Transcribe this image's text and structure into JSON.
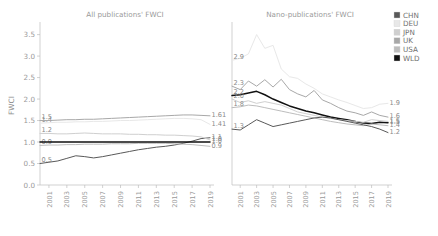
{
  "figure": {
    "y_axis_label": "FWCI",
    "y_ticks": [
      "0.0",
      "0.5",
      "1.0",
      "1.5",
      "2.0",
      "2.5",
      "3.0",
      "3.5"
    ],
    "x_ticks": [
      "2001",
      "2003",
      "2005",
      "2007",
      "2009",
      "2011",
      "2013",
      "2015",
      "2017",
      "2019"
    ]
  },
  "legend": {
    "position": "right",
    "items": [
      {
        "label": "CHN",
        "color": "#595959"
      },
      {
        "label": "DEU",
        "color": "#e8e8e8"
      },
      {
        "label": "JPN",
        "color": "#cfcfcf"
      },
      {
        "label": "UK",
        "color": "#a8a8a8"
      },
      {
        "label": "USA",
        "color": "#bdbdbd"
      },
      {
        "label": "WLD",
        "color": "#111111"
      }
    ]
  },
  "panels": [
    {
      "id": "all",
      "title": "All publications' FWCI"
    },
    {
      "id": "nano",
      "title": "Nano-publications' FWCI"
    }
  ],
  "chart_data": [
    {
      "type": "line",
      "panel": "All publications' FWCI",
      "title": "All publications' FWCI",
      "xlabel": "",
      "ylabel": "FWCI",
      "ylim": [
        0.0,
        3.7
      ],
      "xlim": [
        2000,
        2019
      ],
      "grid": false,
      "x": [
        2000,
        2001,
        2002,
        2003,
        2004,
        2005,
        2006,
        2007,
        2008,
        2009,
        2010,
        2011,
        2012,
        2013,
        2014,
        2015,
        2016,
        2017,
        2018,
        2019
      ],
      "series": [
        {
          "name": "CHN",
          "color": "#595959",
          "values": [
            0.5,
            0.53,
            0.56,
            0.62,
            0.68,
            0.66,
            0.63,
            0.66,
            0.7,
            0.74,
            0.78,
            0.82,
            0.85,
            0.88,
            0.9,
            0.93,
            0.97,
            1.02,
            1.08,
            1.1
          ],
          "start_label": "0.5",
          "end_label": "1.1"
        },
        {
          "name": "DEU",
          "color": "#e8e8e8",
          "values": [
            1.44,
            1.45,
            1.46,
            1.46,
            1.47,
            1.47,
            1.48,
            1.48,
            1.49,
            1.5,
            1.5,
            1.51,
            1.52,
            1.53,
            1.54,
            1.55,
            1.55,
            1.54,
            1.52,
            1.41
          ],
          "start_label": "1.4",
          "end_label": "1.41"
        },
        {
          "name": "JPN",
          "color": "#cfcfcf",
          "values": [
            1.2,
            1.2,
            1.19,
            1.19,
            1.2,
            1.21,
            1.2,
            1.19,
            1.19,
            1.19,
            1.18,
            1.18,
            1.17,
            1.17,
            1.16,
            1.16,
            1.15,
            1.14,
            1.12,
            1.05
          ],
          "start_label": "1.2",
          "end_label": "1.0"
        },
        {
          "name": "UK",
          "color": "#a8a8a8",
          "values": [
            1.5,
            1.5,
            1.51,
            1.52,
            1.52,
            1.53,
            1.53,
            1.54,
            1.55,
            1.56,
            1.57,
            1.58,
            1.59,
            1.6,
            1.61,
            1.62,
            1.63,
            1.63,
            1.62,
            1.61
          ],
          "start_label": "1.5",
          "end_label": "1.61"
        },
        {
          "name": "USA",
          "color": "#bdbdbd",
          "values": [
            0.92,
            0.93,
            0.93,
            0.94,
            0.94,
            0.95,
            0.95,
            0.95,
            0.96,
            0.96,
            0.96,
            0.97,
            0.97,
            0.97,
            0.97,
            0.96,
            0.95,
            0.94,
            0.92,
            0.9
          ],
          "start_label": "0.9",
          "end_label": "0.9"
        },
        {
          "name": "WLD",
          "color": "#111111",
          "values": [
            1.0,
            1.0,
            1.0,
            1.0,
            1.0,
            1.0,
            1.0,
            1.0,
            1.0,
            1.0,
            1.0,
            1.0,
            1.0,
            1.0,
            1.0,
            1.0,
            1.0,
            1.0,
            1.0,
            1.0
          ],
          "start_label": "",
          "end_label": "1.0"
        }
      ]
    },
    {
      "type": "line",
      "panel": "Nano-publications' FWCI",
      "title": "Nano-publications' FWCI",
      "xlabel": "",
      "ylabel": "",
      "ylim": [
        0.0,
        3.7
      ],
      "xlim": [
        2000,
        2019
      ],
      "grid": false,
      "x": [
        2000,
        2001,
        2002,
        2003,
        2004,
        2005,
        2006,
        2007,
        2008,
        2009,
        2010,
        2011,
        2012,
        2013,
        2014,
        2015,
        2016,
        2017,
        2018,
        2019
      ],
      "series": [
        {
          "name": "DEU",
          "color": "#e8e8e8",
          "values": [
            2.9,
            2.95,
            3.05,
            3.5,
            3.18,
            3.25,
            2.7,
            2.52,
            2.48,
            2.35,
            2.25,
            2.12,
            2.05,
            1.98,
            1.92,
            1.85,
            1.78,
            1.8,
            1.88,
            1.9
          ],
          "start_label": "2.9",
          "end_label": "1.9"
        },
        {
          "name": "UK",
          "color": "#a8a8a8",
          "values": [
            2.3,
            2.22,
            2.42,
            2.3,
            2.45,
            2.28,
            2.46,
            2.22,
            2.12,
            2.05,
            2.2,
            1.98,
            1.9,
            1.8,
            1.72,
            1.68,
            1.62,
            1.7,
            1.62,
            1.58
          ],
          "start_label": "2.3",
          "end_label": "1.6"
        },
        {
          "name": "WLD",
          "color": "#111111",
          "values": [
            2.08,
            2.1,
            2.14,
            2.18,
            2.1,
            2.0,
            1.92,
            1.84,
            1.78,
            1.72,
            1.68,
            1.63,
            1.58,
            1.55,
            1.52,
            1.48,
            1.44,
            1.43,
            1.46,
            1.45
          ],
          "start_label": "2.2",
          "end_label": "1.5"
        },
        {
          "name": "JPN",
          "color": "#cfcfcf",
          "values": [
            2.0,
            1.92,
            1.96,
            1.9,
            1.94,
            1.9,
            1.86,
            1.78,
            1.7,
            1.66,
            1.62,
            1.58,
            1.55,
            1.52,
            1.5,
            1.48,
            1.46,
            1.52,
            1.5,
            1.48
          ],
          "start_label": "2.0",
          "end_label": "1.5"
        },
        {
          "name": "USA",
          "color": "#bdbdbd",
          "values": [
            1.8,
            1.82,
            1.86,
            1.84,
            1.8,
            1.76,
            1.72,
            1.68,
            1.64,
            1.6,
            1.56,
            1.52,
            1.48,
            1.45,
            1.42,
            1.4,
            1.38,
            1.42,
            1.4,
            1.38
          ],
          "start_label": "1.8",
          "end_label": "1.4"
        },
        {
          "name": "CHN",
          "color": "#595959",
          "values": [
            1.3,
            1.28,
            1.4,
            1.52,
            1.44,
            1.36,
            1.4,
            1.44,
            1.48,
            1.52,
            1.56,
            1.58,
            1.56,
            1.52,
            1.48,
            1.44,
            1.4,
            1.36,
            1.3,
            1.22
          ],
          "start_label": "1.3",
          "end_label": "1.2"
        }
      ]
    }
  ]
}
